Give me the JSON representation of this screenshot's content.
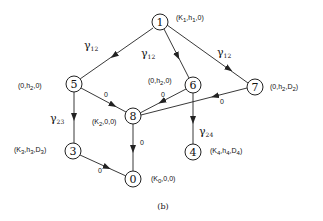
{
  "caption": "(b)",
  "nodes": [
    {
      "id": "1",
      "label": "1",
      "x": 160,
      "y": 22,
      "tuple": {
        "a": "K",
        "as": "1",
        "b": "h",
        "bs": "1",
        "c": "0",
        "cs": ""
      }
    },
    {
      "id": "5",
      "label": "5",
      "x": 74,
      "y": 84,
      "tuple": {
        "a": "0",
        "as": "",
        "b": "h",
        "bs": "2",
        "c": "0",
        "cs": ""
      }
    },
    {
      "id": "6",
      "label": "6",
      "x": 193,
      "y": 85,
      "tuple": {
        "a": "0",
        "as": "",
        "b": "h",
        "bs": "2",
        "c": "0",
        "cs": ""
      }
    },
    {
      "id": "7",
      "label": "7",
      "x": 255,
      "y": 87,
      "tuple": {
        "a": "0",
        "as": "",
        "b": "h",
        "bs": "2",
        "c": "D",
        "cs": "2"
      }
    },
    {
      "id": "8",
      "label": "8",
      "x": 133,
      "y": 116,
      "tuple": {
        "a": "K",
        "as": "2",
        "b": "0",
        "bs": "",
        "c": "0",
        "cs": ""
      }
    },
    {
      "id": "3",
      "label": "3",
      "x": 73,
      "y": 151,
      "tuple": {
        "a": "K",
        "as": "3",
        "b": "h",
        "bs": "3",
        "c": "D",
        "cs": "3"
      }
    },
    {
      "id": "4",
      "label": "4",
      "x": 193,
      "y": 152,
      "tuple": {
        "a": "K",
        "as": "4",
        "b": "h",
        "bs": "4",
        "c": "D",
        "cs": "4"
      }
    },
    {
      "id": "0",
      "label": "0",
      "x": 133,
      "y": 179,
      "tuple": {
        "a": "K",
        "as": "0",
        "b": "0",
        "bs": "",
        "c": "0",
        "cs": ""
      }
    }
  ],
  "edges": [
    {
      "from": "1",
      "to": "5",
      "label": "γ",
      "sub": "12"
    },
    {
      "from": "1",
      "to": "6",
      "label": "γ",
      "sub": "12"
    },
    {
      "from": "1",
      "to": "7",
      "label": "γ",
      "sub": "12"
    },
    {
      "from": "5",
      "to": "8",
      "label": "0",
      "sub": ""
    },
    {
      "from": "6",
      "to": "8",
      "label": "0",
      "sub": ""
    },
    {
      "from": "7",
      "to": "8",
      "label": "0",
      "sub": ""
    },
    {
      "from": "5",
      "to": "3",
      "label": "γ",
      "sub": "23"
    },
    {
      "from": "6",
      "to": "4",
      "label": "γ",
      "sub": "24"
    },
    {
      "from": "8",
      "to": "0",
      "label": "0",
      "sub": ""
    },
    {
      "from": "3",
      "to": "0",
      "label": "0",
      "sub": ""
    }
  ]
}
